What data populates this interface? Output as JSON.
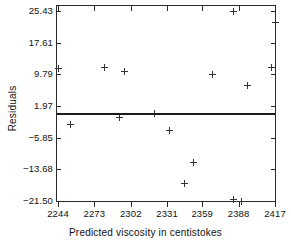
{
  "chart_data": {
    "type": "scatter",
    "title": "",
    "xlabel": "Predicted viscosity in centistokes",
    "ylabel": "Residuals",
    "xlim": [
      2244,
      2417
    ],
    "ylim": [
      -21.5,
      25.43
    ],
    "grid": false,
    "legend": null,
    "xticks": [
      "2244",
      "2273",
      "2302",
      "2331",
      "2359",
      "2388",
      "2417"
    ],
    "xtick_values": [
      2244,
      2273,
      2302,
      2331,
      2359,
      2388,
      2417
    ],
    "yticks": [
      "25.43",
      "17.61",
      "9.79",
      "1.97",
      "-5.85",
      "-13.68",
      "-21.50"
    ],
    "ytick_values": [
      25.43,
      17.61,
      9.79,
      1.97,
      -5.85,
      -13.68,
      -21.5
    ],
    "reference_line": {
      "name": "zero-residual-line",
      "y": 0.0
    },
    "points": [
      {
        "x": 2244,
        "y": 11.3
      },
      {
        "x": 2254,
        "y": -2.6
      },
      {
        "x": 2281,
        "y": 11.5
      },
      {
        "x": 2297,
        "y": 10.4
      },
      {
        "x": 2293,
        "y": -0.9
      },
      {
        "x": 2321,
        "y": 0.1
      },
      {
        "x": 2333,
        "y": -4.0
      },
      {
        "x": 2345,
        "y": -17.2
      },
      {
        "x": 2352,
        "y": -12.1
      },
      {
        "x": 2367,
        "y": 9.8
      },
      {
        "x": 2384,
        "y": 25.4
      },
      {
        "x": 2384,
        "y": -21.2
      },
      {
        "x": 2390,
        "y": -21.6
      },
      {
        "x": 2395,
        "y": 7.0
      },
      {
        "x": 2414,
        "y": 11.4
      },
      {
        "x": 2417,
        "y": 22.6
      }
    ]
  },
  "axes": {
    "x_axis_label": "Predicted viscosity in centistokes",
    "y_axis_label": "Residuals"
  },
  "colors": {
    "marker": "#333333",
    "frame": "#2b2b2b",
    "reference_line": "#1b1b1b",
    "background": "#ffffff"
  }
}
